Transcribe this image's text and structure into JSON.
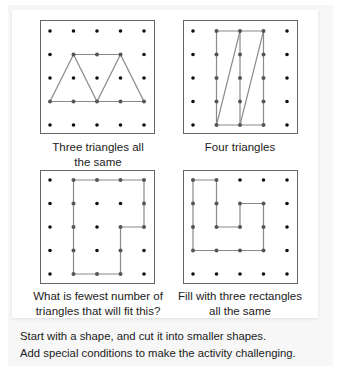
{
  "colors": {
    "line": "#8a8a8a",
    "dot": "#111111",
    "border": "#666666",
    "text": "#222222"
  },
  "panels": [
    {
      "id": "three-triangles",
      "caption_line1": "Three triangles all",
      "caption_line2": "the same",
      "shape_type": "triangles",
      "segments": [
        [
          [
            0,
            3
          ],
          [
            1,
            1
          ]
        ],
        [
          [
            1,
            1
          ],
          [
            2,
            3
          ]
        ],
        [
          [
            1,
            1
          ],
          [
            3,
            1
          ]
        ],
        [
          [
            2,
            3
          ],
          [
            3,
            1
          ]
        ],
        [
          [
            3,
            1
          ],
          [
            4,
            3
          ]
        ],
        [
          [
            0,
            3
          ],
          [
            4,
            3
          ]
        ]
      ]
    },
    {
      "id": "four-triangles",
      "caption_line1": "Four triangles",
      "caption_line2": "",
      "shape_type": "triangles",
      "segments": [
        [
          [
            1,
            0
          ],
          [
            3,
            0
          ]
        ],
        [
          [
            3,
            0
          ],
          [
            3,
            4
          ]
        ],
        [
          [
            3,
            4
          ],
          [
            1,
            4
          ]
        ],
        [
          [
            1,
            4
          ],
          [
            1,
            0
          ]
        ],
        [
          [
            2,
            0
          ],
          [
            2,
            4
          ]
        ],
        [
          [
            2,
            0
          ],
          [
            1,
            4
          ]
        ],
        [
          [
            3,
            0
          ],
          [
            2,
            4
          ]
        ]
      ]
    },
    {
      "id": "fewest-triangles",
      "caption_line1": "What is fewest number of",
      "caption_line2": "triangles that will fit this?",
      "shape_type": "polygon",
      "polygon": [
        [
          1,
          0
        ],
        [
          4,
          0
        ],
        [
          4,
          2
        ],
        [
          3,
          2
        ],
        [
          3,
          4
        ],
        [
          1,
          4
        ]
      ]
    },
    {
      "id": "three-rectangles",
      "caption_line1": "Fill with three rectangles",
      "caption_line2": "all the same",
      "shape_type": "polygon",
      "polygon": [
        [
          0,
          0
        ],
        [
          1,
          0
        ],
        [
          1,
          2
        ],
        [
          2,
          2
        ],
        [
          2,
          1
        ],
        [
          3,
          1
        ],
        [
          3,
          3
        ],
        [
          0,
          3
        ]
      ]
    }
  ],
  "footer": {
    "line1": "Start with a shape, and cut it into smaller shapes.",
    "line2": "Add special conditions to make the activity challenging."
  }
}
